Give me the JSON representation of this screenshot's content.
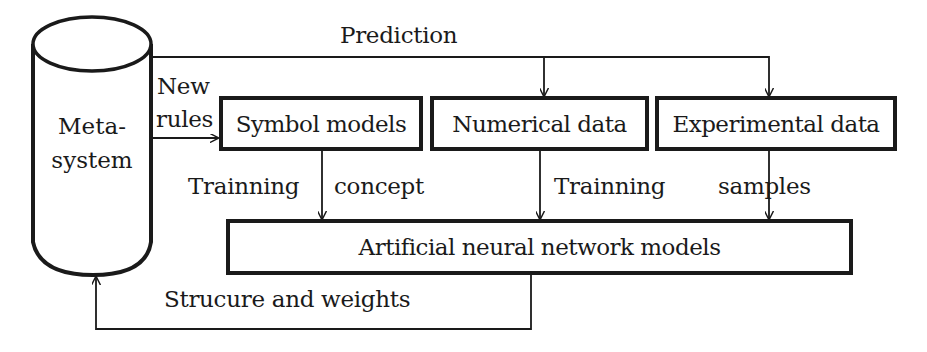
{
  "metasystem": {
    "line1": "Meta-",
    "line2": "system"
  },
  "boxes": {
    "symbol_models": "Symbol models",
    "numerical_data": "Numerical data",
    "experimental_data": "Experimental data",
    "ann_models": "Artificial neural network models"
  },
  "edges": {
    "prediction": "Prediction",
    "new_rules_1": "New",
    "new_rules_2": "rules",
    "trainning_left": "Trainning",
    "concept": "concept",
    "trainning_mid": "Trainning",
    "samples": "samples",
    "structure_weights": "Strucure and weights"
  },
  "colors": {
    "stroke": "#1a1a1a",
    "background": "#ffffff"
  }
}
